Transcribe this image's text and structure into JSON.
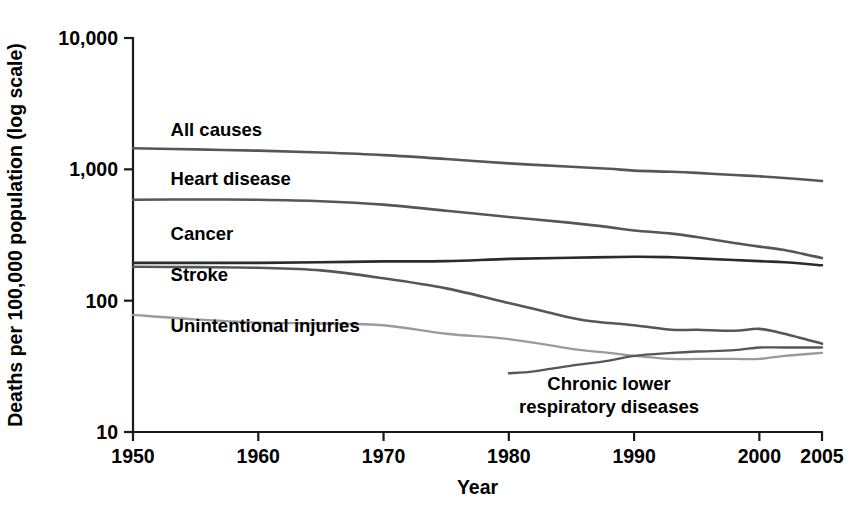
{
  "chart_data": {
    "type": "line",
    "title": "",
    "xlabel": "Year",
    "ylabel": "Deaths per 100,000 population (log scale)",
    "yscale": "log",
    "ylim": [
      10,
      10000
    ],
    "xlim": [
      1950,
      2005
    ],
    "grid": false,
    "legend_position": "inline-labels",
    "y_ticks": [
      "10",
      "100",
      "1,000",
      "10,000"
    ],
    "y_tick_values": [
      10,
      100,
      1000,
      10000
    ],
    "x_ticks": [
      "1950",
      "1960",
      "1970",
      "1980",
      "1990",
      "2000",
      "2005"
    ],
    "x_tick_values": [
      1950,
      1960,
      1970,
      1980,
      1990,
      2000,
      2005
    ],
    "series": [
      {
        "name": "All causes",
        "label": "All causes",
        "color": "#55565a",
        "width": 2.6,
        "label_x": 1953,
        "label_y": 1800,
        "x": [
          1950,
          1955,
          1960,
          1965,
          1970,
          1975,
          1980,
          1985,
          1988,
          1990,
          1993,
          1995,
          1998,
          2000,
          2002,
          2005
        ],
        "values": [
          1446,
          1418,
          1387,
          1342,
          1283,
          1199,
          1110,
          1047,
          1010,
          978,
          958,
          940,
          905,
          885,
          860,
          815
        ]
      },
      {
        "name": "Heart disease",
        "label": "Heart disease",
        "color": "#55565a",
        "width": 2.6,
        "label_x": 1953,
        "label_y": 760,
        "x": [
          1950,
          1955,
          1960,
          1965,
          1970,
          1975,
          1980,
          1985,
          1988,
          1990,
          1993,
          1995,
          1998,
          2000,
          2002,
          2005
        ],
        "values": [
          586,
          590,
          586,
          572,
          539,
          484,
          434,
          391,
          363,
          342,
          324,
          305,
          275,
          258,
          243,
          211
        ]
      },
      {
        "name": "Cancer",
        "label": "Cancer",
        "color": "#2a2b2e",
        "width": 2.6,
        "label_x": 1953,
        "label_y": 290,
        "x": [
          1950,
          1955,
          1960,
          1965,
          1970,
          1975,
          1980,
          1985,
          1990,
          1993,
          1995,
          2000,
          2002,
          2005
        ],
        "values": [
          194,
          194,
          194,
          196,
          199,
          200,
          208,
          212,
          216,
          214,
          210,
          200,
          196,
          186
        ]
      },
      {
        "name": "Stroke",
        "label": "Stroke",
        "color": "#55565a",
        "width": 2.6,
        "label_x": 1953,
        "label_y": 142,
        "x": [
          1950,
          1955,
          1960,
          1965,
          1970,
          1975,
          1980,
          1983,
          1986,
          1990,
          1993,
          1995,
          1998,
          2000,
          2002,
          2005
        ],
        "values": [
          181,
          180,
          178,
          170,
          148,
          124,
          96,
          82,
          71,
          65,
          60,
          60,
          59,
          61,
          56,
          47
        ]
      },
      {
        "name": "Unintentional injuries",
        "label": "Unintentional injuries",
        "color": "#9a9ba0",
        "width": 2.3,
        "label_x": 1953,
        "label_y": 58,
        "x": [
          1950,
          1955,
          1960,
          1965,
          1970,
          1975,
          1980,
          1985,
          1988,
          1990,
          1993,
          1995,
          1998,
          2000,
          2002,
          2005
        ],
        "values": [
          78,
          72,
          68,
          67,
          65,
          56,
          51,
          43,
          40,
          38,
          36,
          36,
          36,
          36,
          38,
          40
        ]
      },
      {
        "name": "Chronic lower respiratory diseases",
        "label": "Chronic lower\nrespiratory diseases",
        "color": "#55565a",
        "width": 2.3,
        "label_x": 1988,
        "label_y": 21,
        "x": [
          1980,
          1982,
          1985,
          1988,
          1990,
          1993,
          1995,
          1998,
          2000,
          2002,
          2005
        ],
        "values": [
          28,
          29,
          32,
          35,
          38,
          40,
          41,
          42,
          44,
          44,
          44
        ]
      }
    ]
  }
}
